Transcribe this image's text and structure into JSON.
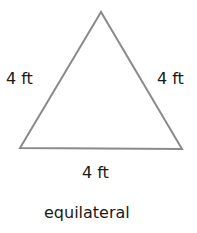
{
  "shape": {
    "type": "triangle",
    "stroke_color": "#8a8a8a",
    "vertices": {
      "apex": [
        101,
        12
      ],
      "bottom_left": [
        20,
        148
      ],
      "bottom_right": [
        182,
        149
      ]
    }
  },
  "labels": {
    "left_side": "4 ft",
    "right_side": "4 ft",
    "bottom_side": "4 ft"
  },
  "caption": "equilateral"
}
